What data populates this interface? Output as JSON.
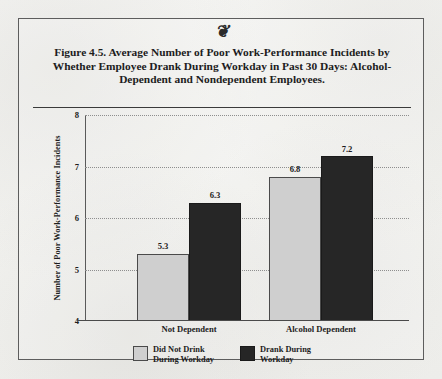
{
  "figure": {
    "ornament": "❦",
    "title": "Figure 4.5.  Average Number of Poor Work-Performance Incidents by Whether Employee Drank During Workday in Past 30 Days: Alcohol-Dependent and Nondependent Employees."
  },
  "colors": {
    "light_bar": "#cfcfcf",
    "dark_bar": "#262626",
    "paper": "#f4f4f2",
    "border": "#5d5d5d",
    "text": "#1d1d1d"
  },
  "chart_data": {
    "type": "bar",
    "title": "Figure 4.5.  Average Number of Poor Work-Performance Incidents by Whether Employee Drank During Workday in Past 30 Days: Alcohol-Dependent and Nondependent Employees.",
    "xlabel": "",
    "ylabel": "Number of Poor Work-Performance Incidents",
    "ylim": [
      4,
      8
    ],
    "yticks": [
      4,
      5,
      6,
      7,
      8
    ],
    "ytick_labels": [
      "4",
      "5",
      "6",
      "7",
      "8"
    ],
    "grid": true,
    "grid_style": "dotted-horizontal",
    "legend_position": "bottom-center",
    "categories": [
      "Not Dependent",
      "Alcohol Dependent"
    ],
    "series": [
      {
        "name": "Did Not Drink During Workday",
        "color": "#cfcfcf",
        "values": [
          5.3,
          6.8
        ],
        "value_labels": [
          "5.3",
          "6.8"
        ]
      },
      {
        "name": "Drank During Workday",
        "color": "#262626",
        "values": [
          6.3,
          7.2
        ],
        "value_labels": [
          "6.3",
          "7.2"
        ]
      }
    ]
  },
  "legend": [
    {
      "label": "Did Not Drink\nDuring Workday",
      "swatch": "light"
    },
    {
      "label": "Drank During\nWorkday",
      "swatch": "dark"
    }
  ]
}
